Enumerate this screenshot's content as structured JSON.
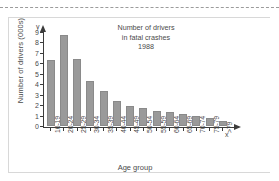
{
  "chart_data": {
    "type": "bar",
    "title": "Number of drivers in fatal crashes 1988",
    "title_lines": [
      "Number of drivers",
      "in fatal crashes",
      "1988"
    ],
    "xlabel": "Age group",
    "ylabel": "Number of drivers (000s)",
    "x_axis_symbol": "x",
    "y_axis_symbol": "y",
    "ylim": [
      0,
      9
    ],
    "y_ticks": [
      0,
      1,
      2,
      3,
      4,
      5,
      6,
      7,
      8,
      9
    ],
    "y_tick_labels": [
      "0",
      "1",
      "2",
      "3",
      "4",
      "5",
      "6",
      "7",
      "8",
      "9"
    ],
    "grid": false,
    "legend": false,
    "bar_color": "#9a9a9a",
    "axis_color": "#3c3c3c",
    "categories": [
      "16-19",
      "20-24",
      "25-29",
      "30-34",
      "35-39",
      "40-44",
      "45-49",
      "50-54",
      "55-59",
      "60-64",
      "65-69",
      "70-74",
      "75-79",
      ">79"
    ],
    "values": [
      6.4,
      8.8,
      6.5,
      4.4,
      3.4,
      2.4,
      2.0,
      1.8,
      1.5,
      1.35,
      1.2,
      1.0,
      0.8,
      0.5
    ]
  }
}
